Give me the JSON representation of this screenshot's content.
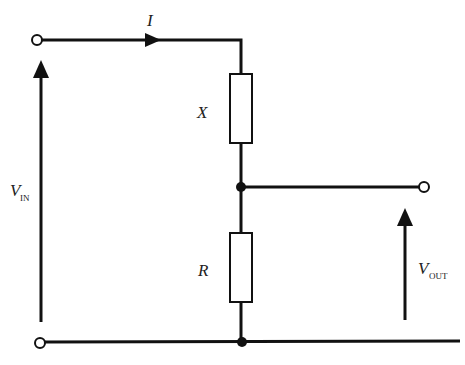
{
  "diagram": {
    "type": "circuit-schematic",
    "labels": {
      "current": "I",
      "component_top": "X",
      "component_bottom": "R",
      "vin_main": "V",
      "vin_sub": "IN",
      "vout_main": "V",
      "vout_sub": "OUT"
    },
    "components": [
      {
        "id": "X",
        "kind": "impedance-box",
        "position": "top"
      },
      {
        "id": "R",
        "kind": "resistor-box",
        "position": "bottom"
      }
    ],
    "terminals": [
      "input-top",
      "input-bottom",
      "output-top"
    ],
    "junctions": [
      "middle-node",
      "ground-node"
    ],
    "colors": {
      "ink": "#111111",
      "background": "#ffffff"
    }
  }
}
